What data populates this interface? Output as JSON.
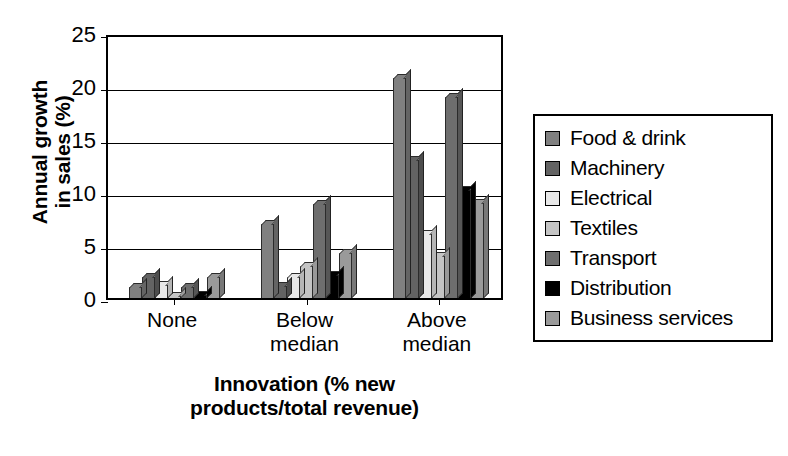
{
  "chart_data": {
    "type": "bar",
    "title": "",
    "xlabel": "Innovation (% new products/total revenue)",
    "xlabel_lines": [
      "Innovation (% new",
      "products/total revenue)"
    ],
    "ylabel": "Annual growth in sales (%)",
    "ylabel_lines": [
      "Annual growth",
      "in sales (%)"
    ],
    "categories": [
      "None",
      "Below median",
      "Above median"
    ],
    "category_lines": [
      [
        "None"
      ],
      [
        "Below",
        "median"
      ],
      [
        "Above",
        "median"
      ]
    ],
    "ylim": [
      0,
      25
    ],
    "yticks": [
      0,
      5,
      10,
      15,
      20,
      25
    ],
    "grid": true,
    "legend_position": "right",
    "series": [
      {
        "name": "Food & drink",
        "color": "#808080",
        "values": [
          1.0,
          7.0,
          20.8
        ]
      },
      {
        "name": "Machinery",
        "color": "#636363",
        "values": [
          2.0,
          1.1,
          13.0
        ]
      },
      {
        "name": "Electrical",
        "color": "#e8e8e8",
        "values": [
          1.2,
          2.0,
          6.0
        ]
      },
      {
        "name": "Textiles",
        "color": "#c4c4c4",
        "values": [
          0.2,
          3.0,
          4.0
        ]
      },
      {
        "name": "Transport",
        "color": "#6e6e6e",
        "values": [
          1.0,
          8.9,
          19.0
        ]
      },
      {
        "name": "Distribution",
        "color": "#000000",
        "values": [
          0.3,
          2.2,
          10.2
        ]
      },
      {
        "name": "Business services",
        "color": "#9a9a9a",
        "values": [
          2.0,
          4.2,
          9.0
        ]
      }
    ]
  }
}
